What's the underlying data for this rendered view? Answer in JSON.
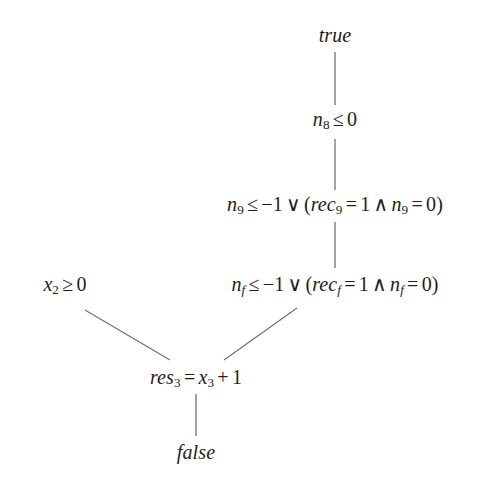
{
  "diagram": {
    "type": "derivation-tree",
    "background_color": "#ffffff",
    "text_color": "#1d1d1d",
    "edge_color": "#707070",
    "nodes": [
      {
        "id": "root-true",
        "name": "node-true",
        "text": "true",
        "style": "italic-keyword",
        "x": 335,
        "y": 35
      },
      {
        "id": "n8",
        "name": "node-n8-le-0",
        "text": "n8 ≤ 0",
        "parts": {
          "var": "n",
          "var_sub": "8",
          "relation": "≤",
          "value": "0"
        },
        "x": 335,
        "y": 120
      },
      {
        "id": "n9",
        "name": "node-n9-disjunction",
        "text": "n9 ≤ −1 ∨ (rec9 = 1 ∧ n9 = 0)",
        "parts": {
          "left_var": "n",
          "left_sub": "9",
          "left_relation": "≤",
          "left_value": "−1",
          "connective_or": "∨",
          "open_paren": "(",
          "rec_var": "rec",
          "rec_sub": "9",
          "rec_relation": "=",
          "rec_value": "1",
          "connective_and": "∧",
          "right_var": "n",
          "right_sub": "9",
          "right_relation": "=",
          "right_value": "0",
          "close_paren": ")"
        },
        "x": 335,
        "y": 205
      },
      {
        "id": "nf",
        "name": "node-nf-disjunction",
        "text": "nf ≤ −1 ∨ (recf = 1 ∧ nf = 0)",
        "parts": {
          "left_var": "n",
          "left_sub": "f",
          "left_relation": "≤",
          "left_value": "−1",
          "connective_or": "∨",
          "open_paren": "(",
          "rec_var": "rec",
          "rec_sub": "f",
          "rec_relation": "=",
          "rec_value": "1",
          "connective_and": "∧",
          "right_var": "n",
          "right_sub": "f",
          "right_relation": "=",
          "right_value": "0",
          "close_paren": ")"
        },
        "x": 335,
        "y": 285
      },
      {
        "id": "x2",
        "name": "node-x2-ge-0",
        "text": "x2 ≥ 0",
        "parts": {
          "var": "x",
          "var_sub": "2",
          "relation": "≥",
          "value": "0"
        },
        "x": 65,
        "y": 285
      },
      {
        "id": "res3",
        "name": "node-res3-assignment",
        "text": "res3 = x3 + 1",
        "parts": {
          "lhs_var": "res",
          "lhs_sub": "3",
          "relation": "=",
          "rhs_var": "x",
          "rhs_sub": "3",
          "plus": "+",
          "addend": "1"
        },
        "x": 196,
        "y": 378
      },
      {
        "id": "leaf-false",
        "name": "node-false",
        "text": "false",
        "style": "italic-keyword",
        "x": 196,
        "y": 452
      }
    ],
    "edges": [
      {
        "name": "edge-true-to-n8",
        "from": "root-true",
        "to": "n8",
        "kind": "vertical",
        "x1": 335,
        "y1": 52,
        "x2": 335,
        "y2": 105
      },
      {
        "name": "edge-n8-to-n9",
        "from": "n8",
        "to": "n9",
        "kind": "vertical",
        "x1": 335,
        "y1": 139,
        "x2": 335,
        "y2": 190
      },
      {
        "name": "edge-n9-to-nf",
        "from": "n9",
        "to": "nf",
        "kind": "vertical",
        "x1": 335,
        "y1": 222,
        "x2": 335,
        "y2": 268
      },
      {
        "name": "edge-x2-to-res3",
        "from": "x2",
        "to": "res3",
        "kind": "diagonal",
        "x1": 85,
        "y1": 310,
        "x2": 170,
        "y2": 360
      },
      {
        "name": "edge-nf-to-res3",
        "from": "nf",
        "to": "res3",
        "kind": "diagonal",
        "x1": 297,
        "y1": 308,
        "x2": 224,
        "y2": 360
      },
      {
        "name": "edge-res3-to-false",
        "from": "res3",
        "to": "leaf-false",
        "kind": "vertical",
        "x1": 196,
        "y1": 394,
        "x2": 196,
        "y2": 436
      }
    ]
  }
}
